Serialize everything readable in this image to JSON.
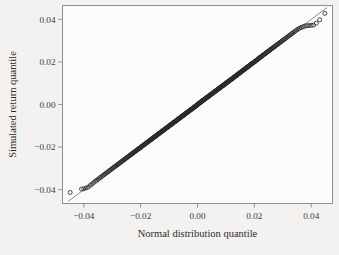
{
  "figure": {
    "background_color": "#f3f2f0",
    "panel_color": "#fcfbfa",
    "frame_color": "#8e8e8e",
    "point_color": "#2b2b2b",
    "line_color": "#6e6e6e"
  },
  "chart_data": {
    "type": "scatter",
    "title": "",
    "subtitle": "",
    "xlabel": "Normal distribution quantile",
    "ylabel": "Simulated return quantile",
    "xlim": [
      -0.0475,
      0.0475
    ],
    "ylim": [
      -0.0465,
      0.0465
    ],
    "xticks": [
      -0.04,
      -0.02,
      0.0,
      0.02,
      0.04
    ],
    "xticklabels": [
      "−0.04",
      "−0.02",
      "0.00",
      "0.02",
      "0.04"
    ],
    "yticks": [
      -0.04,
      -0.02,
      0.0,
      0.02,
      0.04
    ],
    "yticklabels": [
      "−0.04",
      "−0.02",
      "0.00",
      "0.02",
      "0.04"
    ],
    "grid": false,
    "legend": null,
    "annotations": [],
    "marker": "open-circle",
    "marker_size": 2.0,
    "reference_line": {
      "description": "45-degree quantile-quantile reference line",
      "x": [
        -0.0455,
        0.0455
      ],
      "y": [
        -0.0455,
        0.0455
      ]
    },
    "series": [
      {
        "name": "Simulated return quantile vs Normal distribution quantile",
        "x": [
          -0.0448,
          -0.0408,
          -0.04,
          -0.0392,
          -0.0385,
          -0.0377,
          -0.0371,
          -0.0365,
          -0.0359,
          -0.0354,
          -0.0349,
          -0.0344,
          -0.034,
          -0.0335,
          -0.0331,
          -0.0327,
          -0.0323,
          -0.0319,
          -0.0315,
          -0.0311,
          -0.0308,
          -0.0304,
          -0.0301,
          -0.0297,
          -0.0294,
          -0.0291,
          -0.0288,
          -0.0285,
          -0.0282,
          -0.0279,
          -0.0276,
          -0.0273,
          -0.027,
          -0.0267,
          -0.0265,
          -0.0262,
          -0.0259,
          -0.0257,
          -0.0254,
          -0.0252,
          -0.0249,
          -0.0247,
          -0.0244,
          -0.0242,
          -0.0239,
          -0.0237,
          -0.0235,
          -0.0232,
          -0.023,
          -0.0228,
          -0.0226,
          -0.0223,
          -0.0221,
          -0.0219,
          -0.0217,
          -0.0215,
          -0.0213,
          -0.0211,
          -0.0209,
          -0.0207,
          -0.0205,
          -0.0203,
          -0.0201,
          -0.0199,
          -0.0197,
          -0.0195,
          -0.0193,
          -0.0191,
          -0.0189,
          -0.0187,
          -0.0186,
          -0.0184,
          -0.0182,
          -0.018,
          -0.0178,
          -0.0177,
          -0.0175,
          -0.0173,
          -0.0171,
          -0.017,
          -0.0168,
          -0.0166,
          -0.0165,
          -0.0163,
          -0.0161,
          -0.016,
          -0.0158,
          -0.0156,
          -0.0155,
          -0.0153,
          -0.0151,
          -0.015,
          -0.0148,
          -0.0147,
          -0.0145,
          -0.0143,
          -0.0142,
          -0.014,
          -0.0139,
          -0.0137,
          -0.0136,
          -0.0134,
          -0.0133,
          -0.0131,
          -0.013,
          -0.0128,
          -0.0127,
          -0.0125,
          -0.0124,
          -0.0122,
          -0.0121,
          -0.0119,
          -0.0118,
          -0.0116,
          -0.0115,
          -0.0113,
          -0.0112,
          -0.0111,
          -0.0109,
          -0.0108,
          -0.0106,
          -0.0105,
          -0.0103,
          -0.0102,
          -0.0101,
          -0.0099,
          -0.0098,
          -0.0096,
          -0.0095,
          -0.0094,
          -0.0092,
          -0.0091,
          -0.009,
          -0.0088,
          -0.0087,
          -0.0085,
          -0.0084,
          -0.0083,
          -0.0081,
          -0.008,
          -0.0079,
          -0.0077,
          -0.0076,
          -0.0075,
          -0.0073,
          -0.0072,
          -0.0071,
          -0.0069,
          -0.0068,
          -0.0067,
          -0.0065,
          -0.0064,
          -0.0063,
          -0.0061,
          -0.006,
          -0.0059,
          -0.0057,
          -0.0056,
          -0.0055,
          -0.0053,
          -0.0052,
          -0.0051,
          -0.0049,
          -0.0048,
          -0.0047,
          -0.0046,
          -0.0044,
          -0.0043,
          -0.0042,
          -0.004,
          -0.0039,
          -0.0038,
          -0.0036,
          -0.0035,
          -0.0034,
          -0.0033,
          -0.0031,
          -0.003,
          -0.0029,
          -0.0027,
          -0.0026,
          -0.0025,
          -0.0024,
          -0.0022,
          -0.0021,
          -0.002,
          -0.0018,
          -0.0017,
          -0.0016,
          -0.0015,
          -0.0013,
          -0.0012,
          -0.0011,
          -0.0009,
          -0.0008,
          -0.0007,
          -0.0006,
          -0.0004,
          -0.0003,
          -0.0002,
          -0.0001,
          0.0001,
          0.0002,
          0.0003,
          0.0004,
          0.0006,
          0.0007,
          0.0008,
          0.0009,
          0.0011,
          0.0012,
          0.0013,
          0.0015,
          0.0016,
          0.0017,
          0.0018,
          0.002,
          0.0021,
          0.0022,
          0.0024,
          0.0025,
          0.0026,
          0.0027,
          0.0029,
          0.003,
          0.0031,
          0.0033,
          0.0034,
          0.0035,
          0.0036,
          0.0038,
          0.0039,
          0.004,
          0.0042,
          0.0043,
          0.0044,
          0.0046,
          0.0047,
          0.0048,
          0.0049,
          0.0051,
          0.0052,
          0.0053,
          0.0055,
          0.0056,
          0.0057,
          0.0059,
          0.006,
          0.0061,
          0.0063,
          0.0064,
          0.0065,
          0.0067,
          0.0068,
          0.0069,
          0.0071,
          0.0072,
          0.0073,
          0.0075,
          0.0076,
          0.0077,
          0.0079,
          0.008,
          0.0081,
          0.0083,
          0.0084,
          0.0085,
          0.0087,
          0.0088,
          0.009,
          0.0091,
          0.0092,
          0.0094,
          0.0095,
          0.0096,
          0.0098,
          0.0099,
          0.0101,
          0.0102,
          0.0103,
          0.0105,
          0.0106,
          0.0108,
          0.0109,
          0.0111,
          0.0112,
          0.0113,
          0.0115,
          0.0116,
          0.0118,
          0.0119,
          0.0121,
          0.0122,
          0.0124,
          0.0125,
          0.0127,
          0.0128,
          0.013,
          0.0131,
          0.0133,
          0.0134,
          0.0136,
          0.0137,
          0.0139,
          0.014,
          0.0142,
          0.0143,
          0.0145,
          0.0147,
          0.0148,
          0.015,
          0.0151,
          0.0153,
          0.0155,
          0.0156,
          0.0158,
          0.016,
          0.0161,
          0.0163,
          0.0165,
          0.0166,
          0.0168,
          0.017,
          0.0171,
          0.0173,
          0.0175,
          0.0177,
          0.0178,
          0.018,
          0.0182,
          0.0184,
          0.0186,
          0.0187,
          0.0189,
          0.0191,
          0.0193,
          0.0195,
          0.0197,
          0.0199,
          0.0201,
          0.0203,
          0.0205,
          0.0207,
          0.0209,
          0.0211,
          0.0213,
          0.0215,
          0.0217,
          0.0219,
          0.0221,
          0.0223,
          0.0226,
          0.0228,
          0.023,
          0.0232,
          0.0235,
          0.0237,
          0.0239,
          0.0242,
          0.0244,
          0.0247,
          0.0249,
          0.0252,
          0.0254,
          0.0257,
          0.0259,
          0.0262,
          0.0265,
          0.0267,
          0.027,
          0.0273,
          0.0276,
          0.0279,
          0.0282,
          0.0285,
          0.0288,
          0.0291,
          0.0294,
          0.0297,
          0.0301,
          0.0304,
          0.0308,
          0.0311,
          0.0315,
          0.0319,
          0.0323,
          0.0327,
          0.0331,
          0.0335,
          0.034,
          0.0344,
          0.0349,
          0.0354,
          0.0359,
          0.0365,
          0.0371,
          0.0377,
          0.0385,
          0.0392,
          0.04,
          0.0408,
          0.0418,
          0.043,
          0.0448
        ],
        "y": [
          -0.0413,
          -0.0397,
          -0.0396,
          -0.0392,
          -0.0388,
          -0.038,
          -0.0373,
          -0.0366,
          -0.036,
          -0.0355,
          -0.035,
          -0.0345,
          -0.0341,
          -0.0336,
          -0.0332,
          -0.0328,
          -0.0324,
          -0.032,
          -0.0316,
          -0.0312,
          -0.0309,
          -0.0305,
          -0.0302,
          -0.0298,
          -0.0295,
          -0.0292,
          -0.0289,
          -0.0286,
          -0.0283,
          -0.028,
          -0.0277,
          -0.0274,
          -0.0271,
          -0.0268,
          -0.0266,
          -0.0263,
          -0.026,
          -0.0258,
          -0.0255,
          -0.0253,
          -0.025,
          -0.0248,
          -0.0245,
          -0.0243,
          -0.024,
          -0.0238,
          -0.0236,
          -0.0233,
          -0.0231,
          -0.0229,
          -0.0227,
          -0.0224,
          -0.0222,
          -0.022,
          -0.0218,
          -0.0216,
          -0.0214,
          -0.0212,
          -0.021,
          -0.0208,
          -0.0206,
          -0.0204,
          -0.0202,
          -0.02,
          -0.0198,
          -0.0196,
          -0.0194,
          -0.0192,
          -0.019,
          -0.0188,
          -0.0187,
          -0.0185,
          -0.0183,
          -0.0181,
          -0.0179,
          -0.0178,
          -0.0176,
          -0.0174,
          -0.0172,
          -0.0171,
          -0.0169,
          -0.0167,
          -0.0166,
          -0.0164,
          -0.0162,
          -0.0161,
          -0.0159,
          -0.0157,
          -0.0156,
          -0.0154,
          -0.0152,
          -0.0151,
          -0.0149,
          -0.0148,
          -0.0146,
          -0.0144,
          -0.0143,
          -0.0141,
          -0.014,
          -0.0138,
          -0.0137,
          -0.0135,
          -0.0134,
          -0.0132,
          -0.0131,
          -0.0129,
          -0.0128,
          -0.0126,
          -0.0125,
          -0.0123,
          -0.0122,
          -0.012,
          -0.0119,
          -0.0117,
          -0.0116,
          -0.0114,
          -0.0113,
          -0.0112,
          -0.011,
          -0.0109,
          -0.0107,
          -0.0106,
          -0.0104,
          -0.0103,
          -0.0102,
          -0.01,
          -0.0099,
          -0.0097,
          -0.0096,
          -0.0095,
          -0.0093,
          -0.0092,
          -0.0091,
          -0.0089,
          -0.0088,
          -0.0086,
          -0.0085,
          -0.0084,
          -0.0082,
          -0.0081,
          -0.008,
          -0.0078,
          -0.0077,
          -0.0076,
          -0.0074,
          -0.0073,
          -0.0072,
          -0.007,
          -0.0069,
          -0.0068,
          -0.0066,
          -0.0065,
          -0.0064,
          -0.0062,
          -0.0061,
          -0.006,
          -0.0058,
          -0.0057,
          -0.0056,
          -0.0054,
          -0.0053,
          -0.0052,
          -0.005,
          -0.0049,
          -0.0048,
          -0.0047,
          -0.0045,
          -0.0044,
          -0.0043,
          -0.0041,
          -0.004,
          -0.0039,
          -0.0037,
          -0.0036,
          -0.0035,
          -0.0034,
          -0.0032,
          -0.0031,
          -0.003,
          -0.0028,
          -0.0027,
          -0.0026,
          -0.0025,
          -0.0023,
          -0.0022,
          -0.0021,
          -0.0019,
          -0.0018,
          -0.0017,
          -0.0016,
          -0.0014,
          -0.0013,
          -0.0012,
          -0.001,
          -0.0009,
          -0.0008,
          -0.0007,
          -0.0005,
          -0.0004,
          -0.0003,
          -0.0001,
          0.0,
          0.0001,
          0.0003,
          0.0004,
          0.0005,
          0.0007,
          0.0008,
          0.0009,
          0.001,
          0.0012,
          0.0013,
          0.0014,
          0.0016,
          0.0017,
          0.0018,
          0.0019,
          0.0021,
          0.0022,
          0.0023,
          0.0025,
          0.0026,
          0.0027,
          0.0028,
          0.003,
          0.0031,
          0.0032,
          0.0034,
          0.0035,
          0.0036,
          0.0037,
          0.0039,
          0.004,
          0.0041,
          0.0043,
          0.0044,
          0.0045,
          0.0047,
          0.0048,
          0.0049,
          0.005,
          0.0052,
          0.0053,
          0.0054,
          0.0056,
          0.0057,
          0.0058,
          0.006,
          0.0061,
          0.0062,
          0.0064,
          0.0065,
          0.0066,
          0.0068,
          0.0069,
          0.007,
          0.0072,
          0.0073,
          0.0074,
          0.0076,
          0.0077,
          0.0078,
          0.008,
          0.0081,
          0.0082,
          0.0084,
          0.0085,
          0.0086,
          0.0088,
          0.0089,
          0.009,
          0.0092,
          0.0093,
          0.0095,
          0.0096,
          0.0097,
          0.0099,
          0.01,
          0.0102,
          0.0103,
          0.0104,
          0.0106,
          0.0107,
          0.0109,
          0.011,
          0.0112,
          0.0113,
          0.0114,
          0.0116,
          0.0117,
          0.0119,
          0.012,
          0.0122,
          0.0123,
          0.0125,
          0.0126,
          0.0128,
          0.0129,
          0.0131,
          0.0132,
          0.0134,
          0.0135,
          0.0137,
          0.0138,
          0.014,
          0.0142,
          0.0143,
          0.0145,
          0.0146,
          0.0148,
          0.015,
          0.0151,
          0.0153,
          0.0155,
          0.0156,
          0.0158,
          0.016,
          0.0161,
          0.0163,
          0.0165,
          0.0166,
          0.0168,
          0.017,
          0.0172,
          0.0173,
          0.0175,
          0.0177,
          0.0179,
          0.018,
          0.0182,
          0.0184,
          0.0186,
          0.0188,
          0.019,
          0.0192,
          0.0193,
          0.0195,
          0.0197,
          0.0199,
          0.0201,
          0.0203,
          0.0205,
          0.0207,
          0.0209,
          0.0211,
          0.0214,
          0.0216,
          0.0218,
          0.022,
          0.0222,
          0.0224,
          0.0226,
          0.0229,
          0.0231,
          0.0233,
          0.0236,
          0.0238,
          0.024,
          0.0243,
          0.0245,
          0.0248,
          0.025,
          0.0253,
          0.0255,
          0.0258,
          0.026,
          0.0263,
          0.0266,
          0.0268,
          0.0271,
          0.0274,
          0.0277,
          0.028,
          0.0283,
          0.0286,
          0.0289,
          0.0292,
          0.0295,
          0.0298,
          0.0302,
          0.0305,
          0.0308,
          0.0312,
          0.0316,
          0.032,
          0.0324,
          0.0328,
          0.0332,
          0.0336,
          0.0341,
          0.0345,
          0.035,
          0.0354,
          0.0358,
          0.0362,
          0.0365,
          0.0368,
          0.037,
          0.0371,
          0.0372,
          0.0373,
          0.0382,
          0.0398,
          0.0428
        ]
      }
    ]
  }
}
